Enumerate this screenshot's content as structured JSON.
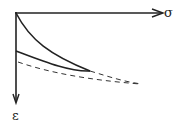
{
  "axes": {
    "x_label": "σ",
    "y_label": "ε"
  },
  "curves": [
    {
      "name": "upper-loading-curve",
      "style": "solid"
    },
    {
      "name": "lower-unloading-curve",
      "style": "solid"
    },
    {
      "name": "continuation-dashed-curve",
      "style": "dashed"
    },
    {
      "name": "lower-dashed-curve",
      "style": "dashed"
    }
  ],
  "colors": {
    "stroke": "#222222",
    "background": "#ffffff"
  }
}
